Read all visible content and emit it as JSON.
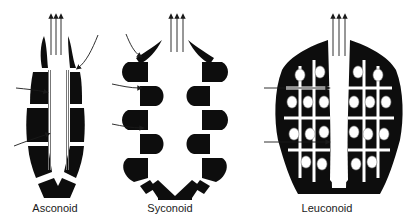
{
  "figure": {
    "colors": {
      "tissue": "#0d0d0d",
      "background": "#ffffff",
      "arrow": "#1a1a1a"
    },
    "panels": [
      {
        "id": "asconoid",
        "label": "Asconoid"
      },
      {
        "id": "syconoid",
        "label": "Syconoid"
      },
      {
        "id": "leuconoid",
        "label": "Leuconoid"
      }
    ]
  }
}
